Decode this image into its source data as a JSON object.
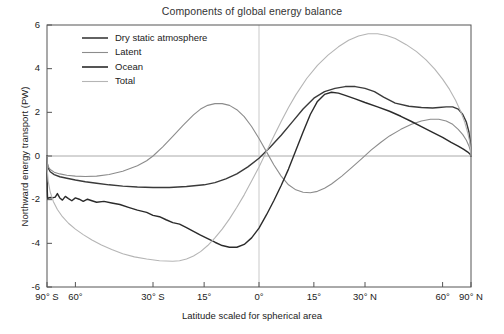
{
  "chart_data": {
    "type": "line",
    "title": "Components of global energy balance",
    "xlabel": "Latitude scaled for spherical area",
    "ylabel": "Northward energy transport (PW)",
    "ylim": [
      -6,
      6
    ],
    "yticks": [
      6,
      4,
      2,
      0,
      -2,
      -4,
      -6
    ],
    "ytick_labels": [
      "6",
      "4",
      "2",
      "0",
      "-2",
      "-4",
      "-6"
    ],
    "xlim_latitude": [
      -90,
      90
    ],
    "x_scale": "sine of latitude (equal spherical area)",
    "xticks_latitude": [
      -90,
      -60,
      -30,
      -15,
      0,
      15,
      30,
      60,
      90
    ],
    "xtick_labels": [
      "90° S",
      "60°",
      "30° S",
      "15°",
      "0°",
      "15°",
      "30° N",
      "60°",
      "90° N"
    ],
    "grid": "zero lines only (horizontal y=0, vertical x=0)",
    "legend_position": "upper left inside axes",
    "colors": {
      "dry_static_atmosphere": "#3a3a3a",
      "latent": "#8c8c8c",
      "ocean": "#2b2b2b",
      "total": "#b5b5b5",
      "axis": "#555555",
      "zero_line": "#aaaaaa"
    },
    "series": [
      {
        "name": "Dry static atmosphere",
        "color": "#3a3a3a",
        "points": [
          [
            -90,
            0.0
          ],
          [
            -87,
            -0.35
          ],
          [
            -84,
            -0.55
          ],
          [
            -80,
            -0.72
          ],
          [
            -75,
            -0.85
          ],
          [
            -70,
            -0.95
          ],
          [
            -65,
            -1.02
          ],
          [
            -60,
            -1.1
          ],
          [
            -55,
            -1.18
          ],
          [
            -50,
            -1.25
          ],
          [
            -45,
            -1.32
          ],
          [
            -40,
            -1.38
          ],
          [
            -35,
            -1.42
          ],
          [
            -30,
            -1.44
          ],
          [
            -25,
            -1.44
          ],
          [
            -20,
            -1.4
          ],
          [
            -15,
            -1.32
          ],
          [
            -12,
            -1.22
          ],
          [
            -9,
            -1.05
          ],
          [
            -6,
            -0.82
          ],
          [
            -3,
            -0.5
          ],
          [
            0,
            -0.1
          ],
          [
            3,
            0.4
          ],
          [
            6,
            0.95
          ],
          [
            9,
            1.55
          ],
          [
            12,
            2.15
          ],
          [
            15,
            2.65
          ],
          [
            18,
            2.95
          ],
          [
            21,
            3.1
          ],
          [
            24,
            3.18
          ],
          [
            27,
            3.18
          ],
          [
            30,
            3.1
          ],
          [
            33,
            2.95
          ],
          [
            36,
            2.7
          ],
          [
            40,
            2.42
          ],
          [
            45,
            2.28
          ],
          [
            50,
            2.22
          ],
          [
            55,
            2.2
          ],
          [
            58,
            2.22
          ],
          [
            62,
            2.25
          ],
          [
            66,
            2.25
          ],
          [
            70,
            2.15
          ],
          [
            74,
            1.9
          ],
          [
            78,
            1.55
          ],
          [
            82,
            1.1
          ],
          [
            86,
            0.55
          ],
          [
            90,
            0.0
          ]
        ]
      },
      {
        "name": "Latent",
        "color": "#8c8c8c",
        "points": [
          [
            -90,
            0.0
          ],
          [
            -87,
            -0.3
          ],
          [
            -84,
            -0.48
          ],
          [
            -80,
            -0.62
          ],
          [
            -75,
            -0.74
          ],
          [
            -70,
            -0.82
          ],
          [
            -65,
            -0.88
          ],
          [
            -60,
            -0.92
          ],
          [
            -55,
            -0.94
          ],
          [
            -50,
            -0.92
          ],
          [
            -45,
            -0.85
          ],
          [
            -40,
            -0.7
          ],
          [
            -35,
            -0.45
          ],
          [
            -32,
            -0.22
          ],
          [
            -30,
            0.0
          ],
          [
            -27,
            0.42
          ],
          [
            -24,
            0.9
          ],
          [
            -21,
            1.4
          ],
          [
            -18,
            1.88
          ],
          [
            -16,
            2.15
          ],
          [
            -14,
            2.32
          ],
          [
            -12,
            2.4
          ],
          [
            -10,
            2.4
          ],
          [
            -8,
            2.32
          ],
          [
            -6,
            2.12
          ],
          [
            -4,
            1.8
          ],
          [
            -2,
            1.35
          ],
          [
            0,
            0.8
          ],
          [
            2,
            0.2
          ],
          [
            4,
            -0.4
          ],
          [
            6,
            -0.92
          ],
          [
            8,
            -1.32
          ],
          [
            10,
            -1.55
          ],
          [
            12,
            -1.66
          ],
          [
            14,
            -1.68
          ],
          [
            16,
            -1.62
          ],
          [
            18,
            -1.48
          ],
          [
            20,
            -1.28
          ],
          [
            23,
            -0.92
          ],
          [
            26,
            -0.52
          ],
          [
            29,
            -0.12
          ],
          [
            32,
            0.28
          ],
          [
            35,
            0.62
          ],
          [
            38,
            0.92
          ],
          [
            42,
            1.22
          ],
          [
            46,
            1.45
          ],
          [
            50,
            1.6
          ],
          [
            54,
            1.68
          ],
          [
            58,
            1.68
          ],
          [
            62,
            1.6
          ],
          [
            66,
            1.45
          ],
          [
            70,
            1.22
          ],
          [
            74,
            0.98
          ],
          [
            78,
            0.72
          ],
          [
            82,
            0.46
          ],
          [
            86,
            0.22
          ],
          [
            90,
            0.0
          ]
        ]
      },
      {
        "name": "Ocean",
        "color": "#2b2b2b",
        "points": [
          [
            -90,
            0.0
          ],
          [
            -89,
            -0.55
          ],
          [
            -88,
            -1.1
          ],
          [
            -87,
            -1.6
          ],
          [
            -86,
            -1.88
          ],
          [
            -85,
            -1.95
          ],
          [
            -83,
            -1.92
          ],
          [
            -80,
            -1.9
          ],
          [
            -77,
            -1.92
          ],
          [
            -74,
            -1.88
          ],
          [
            -72,
            -1.72
          ],
          [
            -70,
            -1.92
          ],
          [
            -68,
            -2.02
          ],
          [
            -66,
            -1.85
          ],
          [
            -64,
            -1.95
          ],
          [
            -62,
            -2.05
          ],
          [
            -60,
            -1.92
          ],
          [
            -58,
            -1.98
          ],
          [
            -56,
            -2.08
          ],
          [
            -54,
            -1.98
          ],
          [
            -52,
            -2.05
          ],
          [
            -50,
            -2.12
          ],
          [
            -47,
            -2.08
          ],
          [
            -44,
            -2.15
          ],
          [
            -41,
            -2.22
          ],
          [
            -38,
            -2.35
          ],
          [
            -35,
            -2.48
          ],
          [
            -32,
            -2.58
          ],
          [
            -30,
            -2.72
          ],
          [
            -28,
            -2.78
          ],
          [
            -26,
            -2.92
          ],
          [
            -24,
            -3.05
          ],
          [
            -22,
            -3.12
          ],
          [
            -20,
            -3.28
          ],
          [
            -18,
            -3.45
          ],
          [
            -16,
            -3.62
          ],
          [
            -14,
            -3.78
          ],
          [
            -12,
            -3.95
          ],
          [
            -10,
            -4.1
          ],
          [
            -8,
            -4.18
          ],
          [
            -6,
            -4.18
          ],
          [
            -4,
            -4.05
          ],
          [
            -2,
            -3.75
          ],
          [
            0,
            -3.3
          ],
          [
            2,
            -2.7
          ],
          [
            4,
            -2.05
          ],
          [
            6,
            -1.35
          ],
          [
            8,
            -0.6
          ],
          [
            10,
            0.25
          ],
          [
            12,
            1.1
          ],
          [
            14,
            1.9
          ],
          [
            16,
            2.5
          ],
          [
            18,
            2.82
          ],
          [
            20,
            2.92
          ],
          [
            22,
            2.88
          ],
          [
            24,
            2.78
          ],
          [
            27,
            2.62
          ],
          [
            30,
            2.45
          ],
          [
            34,
            2.25
          ],
          [
            38,
            2.05
          ],
          [
            42,
            1.82
          ],
          [
            46,
            1.58
          ],
          [
            50,
            1.35
          ],
          [
            55,
            1.08
          ],
          [
            60,
            0.85
          ],
          [
            65,
            0.62
          ],
          [
            70,
            0.45
          ],
          [
            75,
            0.3
          ],
          [
            80,
            0.18
          ],
          [
            85,
            0.08
          ],
          [
            90,
            0.0
          ]
        ]
      },
      {
        "name": "Total",
        "color": "#b5b5b5",
        "points": [
          [
            -90,
            0.0
          ],
          [
            -87,
            -0.65
          ],
          [
            -84,
            -1.15
          ],
          [
            -80,
            -1.65
          ],
          [
            -76,
            -2.08
          ],
          [
            -72,
            -2.45
          ],
          [
            -68,
            -2.78
          ],
          [
            -64,
            -3.08
          ],
          [
            -60,
            -3.35
          ],
          [
            -56,
            -3.6
          ],
          [
            -52,
            -3.85
          ],
          [
            -48,
            -4.08
          ],
          [
            -44,
            -4.28
          ],
          [
            -40,
            -4.48
          ],
          [
            -36,
            -4.62
          ],
          [
            -32,
            -4.72
          ],
          [
            -28,
            -4.8
          ],
          [
            -24,
            -4.82
          ],
          [
            -22,
            -4.8
          ],
          [
            -20,
            -4.72
          ],
          [
            -18,
            -4.58
          ],
          [
            -16,
            -4.38
          ],
          [
            -14,
            -4.1
          ],
          [
            -12,
            -3.75
          ],
          [
            -10,
            -3.35
          ],
          [
            -8,
            -2.88
          ],
          [
            -6,
            -2.35
          ],
          [
            -4,
            -1.78
          ],
          [
            -2,
            -1.15
          ],
          [
            0,
            -0.5
          ],
          [
            2,
            0.2
          ],
          [
            4,
            0.9
          ],
          [
            6,
            1.58
          ],
          [
            8,
            2.22
          ],
          [
            10,
            2.8
          ],
          [
            13,
            3.55
          ],
          [
            16,
            4.15
          ],
          [
            19,
            4.62
          ],
          [
            22,
            5.0
          ],
          [
            25,
            5.3
          ],
          [
            28,
            5.5
          ],
          [
            31,
            5.6
          ],
          [
            34,
            5.6
          ],
          [
            37,
            5.52
          ],
          [
            40,
            5.38
          ],
          [
            44,
            5.1
          ],
          [
            48,
            4.78
          ],
          [
            52,
            4.4
          ],
          [
            56,
            3.98
          ],
          [
            60,
            3.52
          ],
          [
            64,
            3.05
          ],
          [
            68,
            2.55
          ],
          [
            72,
            2.05
          ],
          [
            76,
            1.55
          ],
          [
            80,
            1.05
          ],
          [
            84,
            0.62
          ],
          [
            87,
            0.28
          ],
          [
            90,
            0.0
          ]
        ]
      }
    ]
  },
  "legend": {
    "items": [
      {
        "label": "Dry static atmosphere",
        "color": "#3a3a3a"
      },
      {
        "label": "Latent",
        "color": "#8c8c8c"
      },
      {
        "label": "Ocean",
        "color": "#2b2b2b"
      },
      {
        "label": "Total",
        "color": "#b5b5b5"
      }
    ]
  }
}
